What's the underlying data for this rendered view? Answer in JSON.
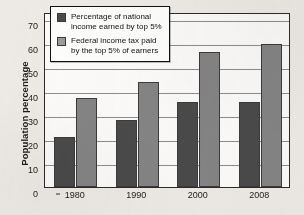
{
  "chart_data": {
    "type": "bar",
    "title": "",
    "xlabel": "",
    "ylabel": "Population percentage",
    "ylim": [
      0,
      73
    ],
    "yticks": [
      0,
      10,
      20,
      30,
      40,
      50,
      60,
      70
    ],
    "grid": true,
    "legend_position": "upper-left-inside",
    "categories": [
      "1980",
      "1990",
      "2000",
      "2008"
    ],
    "series": [
      {
        "name": "Percentage of national income earned by top 5%",
        "color": "#4a4a4a",
        "values": [
          21,
          28,
          35.5,
          35.5
        ]
      },
      {
        "name": "Federal income tax paid by the top 5% of earners",
        "color": "#848484",
        "values": [
          37,
          44,
          56.5,
          59.5
        ]
      }
    ]
  },
  "legend": {
    "entries": [
      {
        "label": "Percentage of national\nincome earned by top 5%"
      },
      {
        "label": "Federal income tax paid\nby the top 5% of earners"
      }
    ]
  },
  "colors": {
    "series_dark": "#4a4a4a",
    "series_gray": "#848484",
    "axis": "#2b2b2b",
    "gridline": "#8d8d8d",
    "plot_background": "#fbfaf8",
    "page_background": "#edeae5"
  }
}
